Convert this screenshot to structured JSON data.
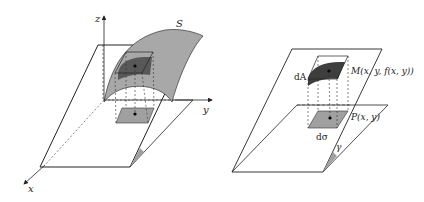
{
  "left_figure": {
    "axis_labels": {
      "z": "z",
      "y": "y",
      "x": "x"
    },
    "surface_label": "S"
  },
  "right_figure": {
    "area_element_label": "dA",
    "point_on_surface_label": "M(x, y, f(x, y))",
    "projection_label": "P(x, y)",
    "plane_element_label": "dσ",
    "angle_label": "γ"
  },
  "colors": {
    "surface_fill": "#a8a8a8",
    "patch_dark": "#4a4a4a",
    "patch_light": "#9a9a9a",
    "line": "#222222"
  }
}
